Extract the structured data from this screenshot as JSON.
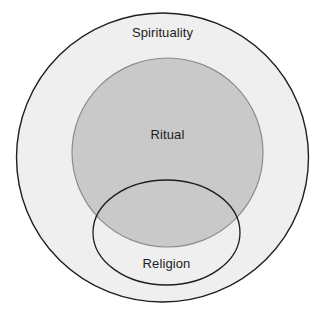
{
  "diagram": {
    "type": "venn",
    "background_color": "#ffffff",
    "sets": [
      {
        "id": "spirituality",
        "label": "Spirituality",
        "shape": "circle",
        "fill_color": "#efefef",
        "stroke_color": "#1f1f1f",
        "stroke_width": 1.4,
        "cx": 162.5,
        "cy": 157.5,
        "rx": 146,
        "ry": 144.5,
        "label_x": 162.5,
        "label_y": 34,
        "relationship": "outermost set containing Ritual and Religion"
      },
      {
        "id": "ritual",
        "label": "Ritual",
        "shape": "circle",
        "fill_color": "#c9c9c9",
        "stroke_color": "#8c8c8c",
        "stroke_width": 1.2,
        "cx": 167.5,
        "cy": 152.5,
        "rx": 95.5,
        "ry": 94.5,
        "label_x": 167.5,
        "label_y": 136,
        "relationship": "nested inside Spirituality, overlaps Religion"
      },
      {
        "id": "religion",
        "label": "Religion",
        "shape": "ellipse",
        "fill_color": "none",
        "stroke_color": "#1f1f1f",
        "stroke_width": 1.3,
        "cx": 166.5,
        "cy": 232.5,
        "rx": 73.5,
        "ry": 52.5,
        "label_x": 166.5,
        "label_y": 265,
        "relationship": "nested inside Spirituality, overlaps lower part of Ritual"
      }
    ],
    "labels": {
      "spirituality": "Spirituality",
      "ritual": "Ritual",
      "religion": "Religion"
    },
    "label_color": "#1c1c1c",
    "label_font_size": 13
  }
}
